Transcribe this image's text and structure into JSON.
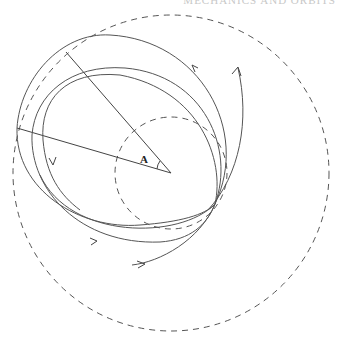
{
  "header": {
    "caption": "MECHANICS AND ORBITS"
  },
  "diagram": {
    "center": {
      "x": 171,
      "y": 173
    },
    "outer_circle": {
      "r": 158,
      "style": "dashed"
    },
    "inner_circle": {
      "r": 56,
      "style": "dashed"
    },
    "angle_label": "A",
    "convergence_point": {
      "x": 215,
      "y": 204
    }
  }
}
